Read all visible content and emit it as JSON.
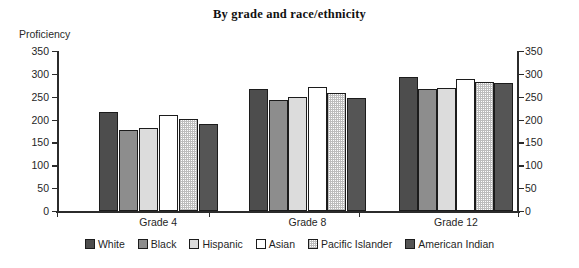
{
  "chart_data": {
    "type": "bar",
    "title": "By grade and race/ethnicity",
    "xlabel": "",
    "ylabel": "Proficiency",
    "ylim": [
      0,
      350
    ],
    "ytick_step": 50,
    "yticks": [
      350,
      300,
      250,
      200,
      150,
      100,
      50,
      0
    ],
    "grid": false,
    "dual_y_axis": true,
    "legend_position": "bottom",
    "categories": [
      "Grade 4",
      "Grade 8",
      "Grade 12"
    ],
    "series": [
      {
        "name": "White",
        "swatch": "#4d4d4d",
        "values": [
          216,
          268,
          293
        ]
      },
      {
        "name": "Black",
        "swatch": "#8d8d8d",
        "values": [
          178,
          242,
          266
        ]
      },
      {
        "name": "Hispanic",
        "swatch": "#dcdcdc",
        "values": [
          182,
          250,
          269
        ]
      },
      {
        "name": "Asian",
        "swatch": "#ffffff",
        "values": [
          209,
          272,
          288
        ]
      },
      {
        "name": "Pacific Islander",
        "swatch": "#e8e8e8",
        "values": [
          201,
          258,
          283
        ]
      },
      {
        "name": "American Indian",
        "swatch": "#555555",
        "values": [
          191,
          247,
          281
        ]
      }
    ]
  },
  "axis": {
    "left_ticks": [
      "350",
      "300",
      "250",
      "200",
      "150",
      "100",
      "50",
      "0"
    ],
    "right_ticks": [
      "350",
      "300",
      "250",
      "200",
      "150",
      "100",
      "50",
      "0"
    ],
    "caption": "Proficiency"
  }
}
